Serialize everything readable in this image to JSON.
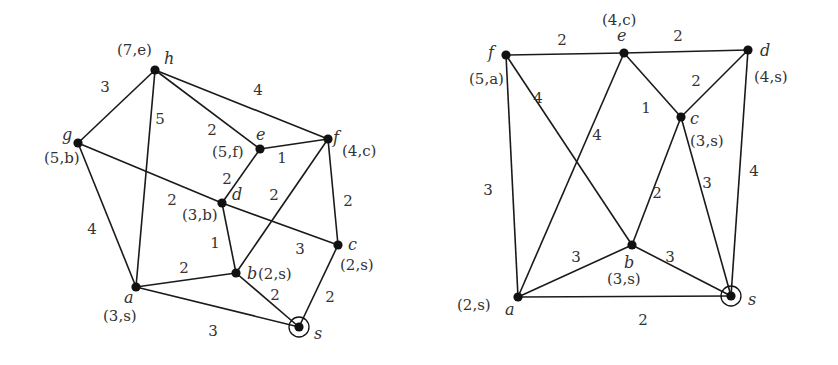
{
  "graphs": [
    {
      "name": "left-graph",
      "source": "s",
      "vertices": [
        {
          "id": "h",
          "x": 155,
          "y": 70,
          "label": "h",
          "lx": 164,
          "ly": 64,
          "tag": "(7,e)",
          "tx": 117,
          "ty": 55
        },
        {
          "id": "g",
          "x": 78,
          "y": 143,
          "label": "g",
          "lx": 62,
          "ly": 140,
          "tag": "(5,b)",
          "tx": 44,
          "ty": 163
        },
        {
          "id": "e",
          "x": 260,
          "y": 149,
          "label": "e",
          "lx": 256,
          "ly": 140,
          "tag": "(5,f)",
          "tx": 212,
          "ty": 157
        },
        {
          "id": "f",
          "x": 328,
          "y": 139,
          "label": "f",
          "lx": 333,
          "ly": 143,
          "tag": "(4,c)",
          "tx": 342,
          "ty": 156
        },
        {
          "id": "d",
          "x": 222,
          "y": 203,
          "label": "d",
          "lx": 232,
          "ly": 200,
          "tag": "(3,b)",
          "tx": 182,
          "ty": 220
        },
        {
          "id": "c",
          "x": 338,
          "y": 245,
          "label": "c",
          "lx": 348,
          "ly": 250,
          "tag": "(2,s)",
          "tx": 340,
          "ty": 270
        },
        {
          "id": "b",
          "x": 236,
          "y": 273,
          "label": "b",
          "lx": 247,
          "ly": 279,
          "tag": "(2,s)",
          "tx": 258,
          "ty": 279
        },
        {
          "id": "a",
          "x": 136,
          "y": 287,
          "label": "a",
          "lx": 124,
          "ly": 303,
          "tag": "(3,s)",
          "tx": 103,
          "ty": 321
        },
        {
          "id": "s",
          "x": 299,
          "y": 327,
          "label": "s",
          "lx": 314,
          "ly": 339,
          "tag": "",
          "tx": 0,
          "ty": 0
        }
      ],
      "edges": [
        {
          "from": "h",
          "to": "g",
          "weight": "3",
          "wx": 105,
          "wy": 92
        },
        {
          "from": "h",
          "to": "a",
          "weight": "5",
          "wx": 160,
          "wy": 124
        },
        {
          "from": "h",
          "to": "e",
          "weight": "2",
          "wx": 212,
          "wy": 135
        },
        {
          "from": "h",
          "to": "f",
          "weight": "4",
          "wx": 258,
          "wy": 95
        },
        {
          "from": "g",
          "to": "a",
          "weight": "4",
          "wx": 92,
          "wy": 234
        },
        {
          "from": "g",
          "to": "d",
          "weight": "2",
          "wx": 172,
          "wy": 205
        },
        {
          "from": "d",
          "to": "c",
          "weight": "3",
          "wx": 300,
          "wy": 254
        },
        {
          "from": "e",
          "to": "d",
          "weight": "2",
          "wx": 227,
          "wy": 184
        },
        {
          "from": "e",
          "to": "f",
          "weight": "1",
          "wx": 282,
          "wy": 163
        },
        {
          "from": "f",
          "to": "b",
          "weight": "2",
          "wx": 274,
          "wy": 200
        },
        {
          "from": "f",
          "to": "c",
          "weight": "2",
          "wx": 348,
          "wy": 206
        },
        {
          "from": "d",
          "to": "b",
          "weight": "1",
          "wx": 215,
          "wy": 248
        },
        {
          "from": "a",
          "to": "b",
          "weight": "2",
          "wx": 184,
          "wy": 273
        },
        {
          "from": "a",
          "to": "s",
          "weight": "3",
          "wx": 213,
          "wy": 336
        },
        {
          "from": "b",
          "to": "s",
          "weight": "2",
          "wx": 275,
          "wy": 300
        },
        {
          "from": "c",
          "to": "s",
          "weight": "2",
          "wx": 330,
          "wy": 302
        }
      ]
    },
    {
      "name": "right-graph",
      "source": "s",
      "vertices": [
        {
          "id": "f",
          "x": 506,
          "y": 55,
          "label": "f",
          "lx": 488,
          "ly": 58,
          "tag": "(5,a)",
          "tx": 469,
          "ty": 84
        },
        {
          "id": "e",
          "x": 624,
          "y": 53,
          "label": "e",
          "lx": 617,
          "ly": 41,
          "tag": "(4,c)",
          "tx": 602,
          "ty": 25
        },
        {
          "id": "d",
          "x": 748,
          "y": 50,
          "label": "d",
          "lx": 760,
          "ly": 56,
          "tag": "(4,s)",
          "tx": 754,
          "ty": 82
        },
        {
          "id": "c",
          "x": 681,
          "y": 117,
          "label": "c",
          "lx": 690,
          "ly": 124,
          "tag": "(3,s)",
          "tx": 690,
          "ty": 146
        },
        {
          "id": "b",
          "x": 632,
          "y": 245,
          "label": "b",
          "lx": 624,
          "ly": 268,
          "tag": "(3,s)",
          "tx": 607,
          "ty": 284
        },
        {
          "id": "a",
          "x": 518,
          "y": 297,
          "label": "a",
          "lx": 505,
          "ly": 315,
          "tag": "(2,s)",
          "tx": 457,
          "ty": 310
        },
        {
          "id": "s",
          "x": 731,
          "y": 296,
          "label": "s",
          "lx": 748,
          "ly": 305,
          "tag": "",
          "tx": 0,
          "ty": 0
        }
      ],
      "edges": [
        {
          "from": "f",
          "to": "e",
          "weight": "2",
          "wx": 562,
          "wy": 45
        },
        {
          "from": "e",
          "to": "d",
          "weight": "2",
          "wx": 678,
          "wy": 41
        },
        {
          "from": "e",
          "to": "c",
          "weight": "1",
          "wx": 646,
          "wy": 113
        },
        {
          "from": "c",
          "to": "d",
          "weight": "2",
          "wx": 696,
          "wy": 86
        },
        {
          "from": "f",
          "to": "b",
          "weight": "4",
          "wx": 538,
          "wy": 103
        },
        {
          "from": "e",
          "to": "a",
          "weight": "4",
          "wx": 597,
          "wy": 140
        },
        {
          "from": "f",
          "to": "a",
          "weight": "3",
          "wx": 488,
          "wy": 195
        },
        {
          "from": "c",
          "to": "b",
          "weight": "2",
          "wx": 657,
          "wy": 198
        },
        {
          "from": "c",
          "to": "s",
          "weight": "3",
          "wx": 707,
          "wy": 188
        },
        {
          "from": "d",
          "to": "s",
          "weight": "4",
          "wx": 754,
          "wy": 176
        },
        {
          "from": "a",
          "to": "b",
          "weight": "3",
          "wx": 576,
          "wy": 262
        },
        {
          "from": "b",
          "to": "s",
          "weight": "3",
          "wx": 670,
          "wy": 262
        },
        {
          "from": "a",
          "to": "s",
          "weight": "2",
          "wx": 643,
          "wy": 325
        }
      ]
    }
  ],
  "colors": {
    "edge": "#1a1a1a",
    "node": "#111111",
    "text": "#333333",
    "background": "#ffffff"
  }
}
